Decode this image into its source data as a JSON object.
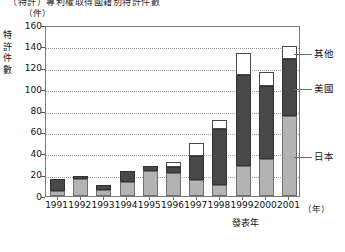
{
  "figure": {
    "title_fragment": "（特許）專利權取得國籍別特許件數",
    "y_axis_title": "特許件數",
    "y_unit": "（件）",
    "x_axis_title": "發表年",
    "x_unit": "（年）"
  },
  "legend": {
    "items": [
      {
        "key": "other",
        "label": "其他",
        "color": "#ffffff"
      },
      {
        "key": "usa",
        "label": "美國",
        "color": "#484848"
      },
      {
        "key": "japan",
        "label": "日本",
        "color": "#b3b3b3"
      }
    ]
  },
  "chart_data": {
    "type": "bar",
    "stacked": true,
    "title": "（特許）專利權取得國籍別特許件數",
    "xlabel": "發表年",
    "ylabel": "特許件數",
    "x_unit": "（年）",
    "y_unit": "（件）",
    "grid": true,
    "legend_position": "right",
    "ylim": [
      0,
      160
    ],
    "yticks": [
      0,
      20,
      40,
      60,
      80,
      100,
      120,
      140,
      160
    ],
    "categories": [
      "1991",
      "1992",
      "1993",
      "1994",
      "1995",
      "1996",
      "1997",
      "1998",
      "1999",
      "2000",
      "2001"
    ],
    "series": [
      {
        "name": "日本",
        "color": "#b3b3b3",
        "values": [
          5,
          16,
          6,
          13,
          23,
          22,
          15,
          10,
          28,
          35,
          75
        ]
      },
      {
        "name": "美國",
        "color": "#484848",
        "values": [
          11,
          3,
          4,
          10,
          5,
          5,
          22,
          53,
          85,
          68,
          53
        ]
      },
      {
        "name": "其他",
        "color": "#ffffff",
        "values": [
          0,
          0,
          0,
          0,
          0,
          5,
          13,
          8,
          21,
          13,
          12
        ]
      }
    ],
    "totals": [
      16,
      19,
      10,
      23,
      28,
      32,
      50,
      71,
      134,
      116,
      140
    ]
  }
}
